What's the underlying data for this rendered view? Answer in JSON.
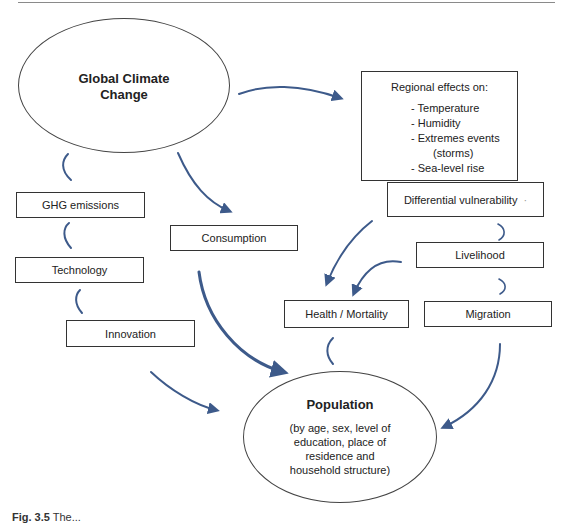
{
  "diagram": {
    "nodes": {
      "global_climate_change": {
        "label": "Global Climate Change",
        "line1": "Global Climate",
        "line2": "Change"
      },
      "regional_effects": {
        "heading": "Regional effects on:",
        "items": [
          "- Temperature",
          "- Humidity",
          "- Extremes events",
          "(storms)",
          "- Sea-level rise"
        ]
      },
      "differential_vulnerability": {
        "label": "Differential vulnerability",
        "mark": "·"
      },
      "livelihood": {
        "label": "Livelihood"
      },
      "health_mortality": {
        "label": "Health / Mortality"
      },
      "migration": {
        "label": "Migration"
      },
      "ghg_emissions": {
        "label": "GHG emissions"
      },
      "technology": {
        "label": "Technology"
      },
      "innovation": {
        "label": "Innovation"
      },
      "consumption": {
        "label": "Consumption"
      },
      "population": {
        "title": "Population",
        "detail_lines": [
          "(by age, sex, level of",
          "education, place of",
          "residence and",
          "household structure)"
        ]
      }
    },
    "edges": [
      {
        "from": "Global Climate Change",
        "to": "Regional effects"
      },
      {
        "from": "Regional effects",
        "to": "Differential vulnerability"
      },
      {
        "from": "Differential vulnerability",
        "to": "Livelihood"
      },
      {
        "from": "Livelihood",
        "to": "Migration"
      },
      {
        "from": "Differential vulnerability",
        "to": "Health / Mortality"
      },
      {
        "from": "Livelihood",
        "to": "Health / Mortality"
      },
      {
        "from": "Health / Mortality",
        "to": "Population"
      },
      {
        "from": "Migration",
        "to": "Population"
      },
      {
        "from": "Global Climate Change",
        "to": "Consumption"
      },
      {
        "from": "Consumption",
        "to": "Population"
      },
      {
        "from": "Innovation",
        "to": "Technology"
      },
      {
        "from": "Technology",
        "to": "GHG emissions"
      },
      {
        "from": "GHG emissions",
        "to": "Global Climate Change"
      },
      {
        "from": "Innovation",
        "to": "Population"
      }
    ],
    "arrow_color": "#3d5a8a"
  },
  "caption": {
    "label": "Fig. 3.5",
    "text": "The..."
  }
}
